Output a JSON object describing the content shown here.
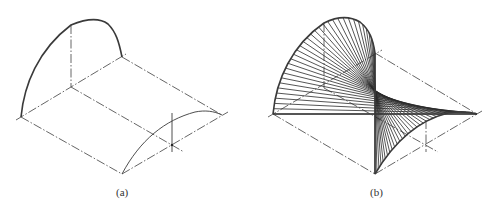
{
  "figure": {
    "top_text_fragment": "",
    "panels": [
      {
        "id": "a",
        "caption": "(a)",
        "description": "Isometric view of a quarter-cylinder-like surface: quarter arc on the back plane, quarter arc on the front plane, dash-dot center lines and axes",
        "points": {
          "left_corner": [
            21,
            117
          ],
          "back_center": [
            71,
            87
          ],
          "back_axis_top": [
            71,
            25
          ],
          "back_arc_end": [
            122,
            57
          ],
          "front_left_corner": [
            122,
            174
          ],
          "front_center": [
            172,
            145
          ],
          "front_right_corner": [
            222,
            115
          ]
        },
        "caption_pos": [
          116,
          190
        ]
      },
      {
        "id": "b",
        "caption": "(b)",
        "description": "Isometric view of a twisted ruled surface generated by straight lines joining a back quarter arc to a front quarter arc",
        "points": {
          "left_corner": [
            273,
            114
          ],
          "back_center": [
            324,
            88
          ],
          "back_axis_top": [
            324,
            23
          ],
          "back_arc_end": [
            375,
            53
          ],
          "front_left_corner": [
            375,
            174
          ],
          "front_center": [
            426,
            145
          ],
          "front_right_corner": [
            477,
            114
          ]
        },
        "ruling_count": 34,
        "caption_pos": [
          370,
          190
        ]
      }
    ],
    "colors": {
      "line": "#3a3a3a",
      "centerline": "#555555",
      "background": "#ffffff"
    }
  }
}
